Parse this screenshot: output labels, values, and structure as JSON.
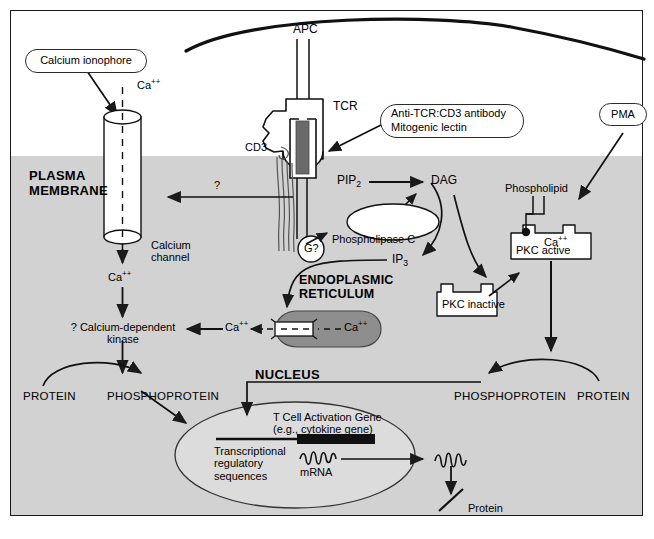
{
  "figure": {
    "membrane_label_line1": "PLASMA",
    "membrane_label_line2": "MEMBRANE",
    "cytoplasm_color": "#d2d2d2",
    "background_color": "#ffffff",
    "line_color": "#1a1a1a"
  },
  "callouts": [
    {
      "id": "calcium-ionophore",
      "lines": [
        "Calcium ionophore"
      ]
    },
    {
      "id": "anti-tcr-cd3-antibody",
      "lines": [
        "Anti-TCR:CD3 antibody",
        "Mitogenic lectin"
      ]
    },
    {
      "id": "pma",
      "lines": [
        "PMA"
      ]
    }
  ],
  "labels": {
    "apc": "APC",
    "tcr": "TCR",
    "cd3": "CD3",
    "g_protein": "G?",
    "calcium_ion": "Ca",
    "calcium_charge": "++",
    "calcium_channel_line1": "Calcium",
    "calcium_channel_line2": "channel",
    "question_arrow": "?",
    "calcium_dependent_kinase_line1": "? Calcium-dependent",
    "calcium_dependent_kinase_line2": "kinase",
    "pip2": "PIP",
    "pip2_sub": "2",
    "dag": "DAG",
    "ip3": "IP",
    "ip3_sub": "3",
    "phospholipase_c": "Phospholipase C",
    "phospholipid": "Phospholipid",
    "pkc_active": "PKC  active",
    "pkc_inactive": "PKC inactive",
    "endoplasmic_reticulum_line1": "ENDOPLASMIC",
    "endoplasmic_reticulum_line2": "RETICULUM",
    "nucleus": "NUCLEUS",
    "protein_left": "PROTEIN",
    "phosphoprotein_left": "PHOSPHOPROTEIN",
    "phosphoprotein_right": "PHOSPHOPROTEIN",
    "protein_right": "PROTEIN",
    "gene_line1": "T Cell Activation Gene",
    "gene_line2": "(e.g., cytokine gene)",
    "transcriptional_line1": "Transcriptional",
    "transcriptional_line2": "regulatory",
    "transcriptional_line3": "sequences",
    "mrna": "mRNA",
    "protein_product": "Protein"
  },
  "icons": {
    "apc_membrane": "apc-membrane-curve-icon",
    "tcr_receptor": "tcr-receptor-icon",
    "cd3_chains": "cd3-chain-icon",
    "calcium_channel": "calcium-channel-cylinder-icon",
    "g_protein_circle": "g-protein-icon",
    "plc_ellipse": "phospholipase-c-ellipse-icon",
    "er_body": "endoplasmic-reticulum-icon",
    "er_channel": "er-calcium-channel-icon",
    "pkc_active_box": "pkc-active-icon",
    "pkc_inactive_box": "pkc-inactive-icon",
    "phospholipid_head": "phospholipid-icon",
    "nucleus_ellipse": "nucleus-icon",
    "gene_bar": "gene-bar-icon",
    "mrna_squiggle": "mrna-squiggle-icon",
    "protein_squiggle": "protein-squiggle-icon",
    "protein_stroke": "protein-polypeptide-icon"
  }
}
